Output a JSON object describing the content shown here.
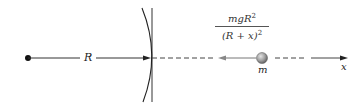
{
  "diagram": {
    "type": "gravitational force on mass above Earth's surface",
    "labels": {
      "radius": "R",
      "mass": "m",
      "axis": "x",
      "force_numerator": "mgR",
      "force_numerator_exp": "2",
      "force_denominator": "(R + x)",
      "force_denominator_exp": "2"
    },
    "elements": [
      {
        "id": "earth-center",
        "shape": "dot"
      },
      {
        "id": "radius-arrow",
        "shape": "arrow",
        "label": "R"
      },
      {
        "id": "earth-surface",
        "shape": "arc + vertical line"
      },
      {
        "id": "mass",
        "shape": "sphere",
        "label": "m"
      },
      {
        "id": "force-arrow",
        "shape": "arrow pointing toward Earth",
        "label": "mgR^2/(R + x)^2"
      },
      {
        "id": "x-axis",
        "shape": "dashed line ending in arrow",
        "label": "x"
      }
    ],
    "colors": {
      "line": "#333333",
      "ball_fill": "#9a9a9a",
      "ball_highlight": "#d8d8d8",
      "force_arrow": "#777777"
    }
  }
}
